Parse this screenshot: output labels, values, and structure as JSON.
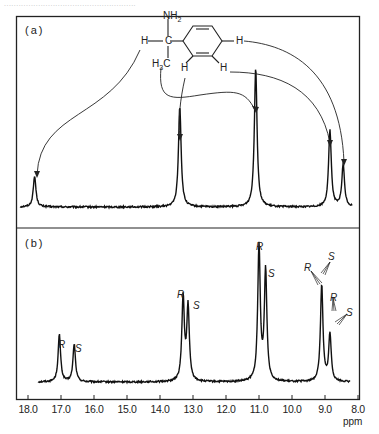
{
  "header_cut_text": "......................................................",
  "chart_data": [
    {
      "panel": "(a)",
      "type": "line",
      "title": "",
      "xlabel": "ppm",
      "ylabel": "",
      "xlim": [
        18.0,
        8.0
      ],
      "x_reversed": true,
      "molecule": "1-phenylethylamine (NH2, H-C, H3C, ring H)",
      "molecule_labels": [
        "NH2",
        "H",
        "C",
        "H3C",
        "H",
        "H",
        "H"
      ],
      "peaks": [
        {
          "ppm": 17.8,
          "rel_height": 0.22,
          "assignment": "H-C (methine)"
        },
        {
          "ppm": 13.4,
          "rel_height": 0.72,
          "assignment": "ortho H"
        },
        {
          "ppm": 11.1,
          "rel_height": 1.0,
          "assignment": "H3C (methyl)"
        },
        {
          "ppm": 8.85,
          "rel_height": 0.55,
          "assignment": "meta H"
        },
        {
          "ppm": 8.45,
          "rel_height": 0.3,
          "assignment": "para H"
        }
      ]
    },
    {
      "panel": "(b)",
      "type": "line",
      "title": "",
      "xlabel": "ppm",
      "ylabel": "",
      "xlim": [
        18.0,
        8.0
      ],
      "x_reversed": true,
      "peaks": [
        {
          "ppm": 17.05,
          "rel_height": 0.35,
          "label": "R"
        },
        {
          "ppm": 16.6,
          "rel_height": 0.28,
          "label": "S"
        },
        {
          "ppm": 13.3,
          "rel_height": 0.62,
          "label": "R"
        },
        {
          "ppm": 13.15,
          "rel_height": 0.55,
          "label": "S"
        },
        {
          "ppm": 11.0,
          "rel_height": 1.0,
          "label": "R"
        },
        {
          "ppm": 10.8,
          "rel_height": 0.82,
          "label": "S"
        },
        {
          "ppm": 9.1,
          "rel_height": 0.72,
          "label": "R/S"
        },
        {
          "ppm": 8.85,
          "rel_height": 0.35,
          "label": "R/S"
        }
      ]
    }
  ],
  "axis": {
    "ticks": [
      "18.0",
      "17.0",
      "16.0",
      "15.0",
      "14.0",
      "13.0",
      "12.0",
      "11.0",
      "10.0",
      "9.0",
      "8.0"
    ],
    "unit": "ppm"
  },
  "panels": {
    "a_label": "(a)",
    "b_label": "(b)"
  },
  "molecule": {
    "nh2": "NH",
    "nh2_sub": "2",
    "h_left": "H",
    "c": "C",
    "h3c_h": "H",
    "h3c_sub": "3",
    "h3c_c": "C",
    "h_ortho": "H",
    "h_meta": "H",
    "h_para": "H"
  },
  "peak_labels_b": {
    "r1": "R",
    "s1": "S",
    "r2": "R",
    "s2": "S",
    "r3": "R",
    "s3": "S",
    "r4": "R",
    "s4": "S",
    "r5": "R",
    "s5": "S"
  }
}
